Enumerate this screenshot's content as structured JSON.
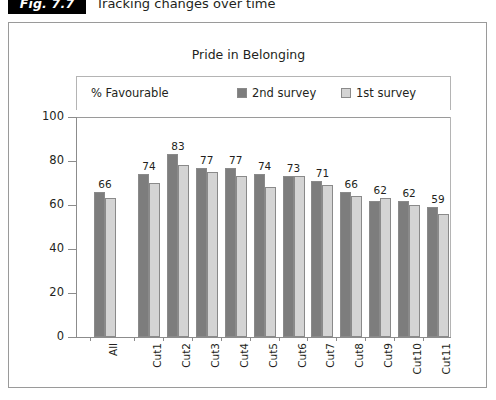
{
  "figure": {
    "tag": "Fig. 7.7",
    "caption": "Tracking changes over time"
  },
  "chart_data": {
    "type": "bar",
    "title": "Pride in Belonging",
    "xlabel": "",
    "ylabel": "% Favourable",
    "ylim": [
      0,
      100
    ],
    "yticks": [
      0,
      20,
      40,
      60,
      80,
      100
    ],
    "grid": false,
    "legend_position": "top",
    "value_labels_series": "2nd survey",
    "categories": [
      "All",
      "Cut1",
      "Cut2",
      "Cut3",
      "Cut4",
      "Cut5",
      "Cut6",
      "Cut7",
      "Cut8",
      "Cut9",
      "Cut10",
      "Cut11"
    ],
    "series": [
      {
        "name": "2nd survey",
        "color": "#7d7d7d",
        "values": [
          66,
          74,
          83,
          77,
          77,
          74,
          73,
          71,
          66,
          62,
          62,
          59
        ]
      },
      {
        "name": "1st survey",
        "color": "#d4d4d4",
        "values": [
          63,
          70,
          78,
          75,
          73,
          68,
          73,
          69,
          64,
          63,
          60,
          56
        ]
      }
    ]
  }
}
